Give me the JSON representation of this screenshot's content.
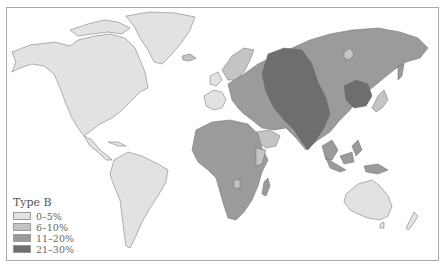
{
  "map": {
    "title": "Type B",
    "description": "World distribution of blood type B frequency",
    "legend": {
      "title": "Type B",
      "items": [
        {
          "label": "0–5%",
          "color": "#e2e2e2"
        },
        {
          "label": "6–10%",
          "color": "#c4c4c4"
        },
        {
          "label": "11–20%",
          "color": "#9b9b9b"
        },
        {
          "label": "21–30%",
          "color": "#6e6e6e"
        }
      ]
    },
    "colors": {
      "background": "#ffffff",
      "frame": "#a8a8a8",
      "coast": "#555555"
    }
  }
}
